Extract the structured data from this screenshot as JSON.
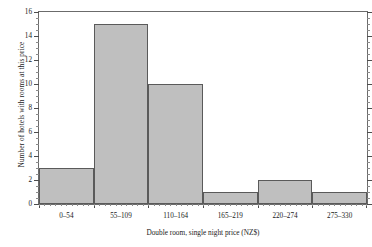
{
  "chart_data": {
    "type": "bar",
    "title": "",
    "subtitle": "",
    "xlabel": "Double room, single night price (NZ$)",
    "ylabel": "Number of hotels with rooms at this price",
    "categories": [
      "0–54",
      "55–109",
      "110–164",
      "165–219",
      "220–274",
      "275–330"
    ],
    "values": [
      3,
      15,
      10,
      1,
      2,
      1
    ],
    "ylim": [
      0,
      16
    ],
    "ytick_labels": [
      "0",
      "2",
      "4",
      "6",
      "8",
      "10",
      "12",
      "14",
      "16"
    ],
    "ytick_values": [
      0,
      2,
      4,
      6,
      8,
      10,
      12,
      14,
      16
    ],
    "y_minor_step": 0.5,
    "grid": false,
    "legend": null,
    "legend_position": "none",
    "bar_fill_color": "#bfbfbf",
    "bar_edge_color": "#5a5a5a",
    "axis_color": "#6b6b6b",
    "background_color": "#ffffff",
    "series": [
      {
        "name": "Number of hotels with rooms at this price",
        "values": [
          3,
          15,
          10,
          1,
          2,
          1
        ]
      }
    ]
  }
}
